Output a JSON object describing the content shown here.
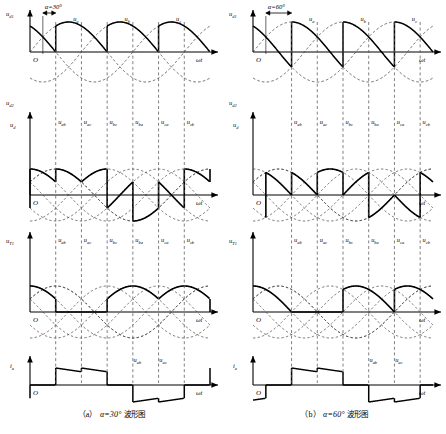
{
  "figure": {
    "background_color": "#ffffff",
    "line_color": "#000000",
    "dash_color": "#444444"
  },
  "panels": [
    {
      "id": "panel-a",
      "alpha_label": "α=30°",
      "alpha_deg": 30,
      "caption": "（a） α=30° 波形图",
      "caption_index": "（a）",
      "caption_text": "波形图",
      "axis_label_omega": "ωt",
      "origin_label": "O",
      "subplots": [
        {
          "id": "ud1",
          "y_label": "u d1",
          "y_label_main": "u",
          "y_label_sub": "d1",
          "phase_labels": [
            "u a",
            "u b",
            "u c"
          ],
          "phase_label_mains": [
            "u",
            "u",
            "u"
          ],
          "phase_label_subs": [
            "a",
            "b",
            "c"
          ],
          "description": "三相相电压及共阴极组输出电压波形"
        },
        {
          "id": "ud2",
          "y_label_top": "u d2",
          "y_label_top_main": "u",
          "y_label_top_sub": "d2",
          "y_label_bottom": "u d",
          "y_label_bottom_main": "u",
          "y_label_bottom_sub": "d",
          "line_voltage_labels": [
            "u ab",
            "u ac",
            "u bc",
            "u ba",
            "u ca",
            "u cb"
          ],
          "line_voltage_subs": [
            "ab",
            "ac",
            "bc",
            "ba",
            "ca",
            "cb"
          ],
          "description": "线电压与整流输出电压 ud 波形"
        },
        {
          "id": "uT1",
          "y_label": "u T1",
          "y_label_main": "u",
          "y_label_sub": "T1",
          "line_voltage_labels": [
            "u ab",
            "u ac",
            "u bc",
            "u ba",
            "u ca",
            "u cb"
          ],
          "line_voltage_subs": [
            "ab",
            "ac",
            "bc",
            "ba",
            "ca",
            "cb"
          ],
          "description": "晶闸管 T1 两端电压波形"
        },
        {
          "id": "ia",
          "y_label": "i a",
          "y_label_main": "i",
          "y_label_sub": "a",
          "marker_labels": [
            "u ab",
            "u ac"
          ],
          "marker_subs": [
            "ab",
            "ac"
          ],
          "description": "a 相电流波形"
        }
      ]
    },
    {
      "id": "panel-b",
      "alpha_label": "α=60°",
      "alpha_deg": 60,
      "caption": "（b） α=60° 波形图",
      "caption_index": "（b）",
      "caption_text": "波形图",
      "axis_label_omega": "ωt",
      "origin_label": "O",
      "subplots": [
        {
          "id": "ud1",
          "y_label": "u d1",
          "y_label_main": "u",
          "y_label_sub": "d1",
          "phase_labels": [
            "u a",
            "u b",
            "u c"
          ],
          "phase_label_mains": [
            "u",
            "u",
            "u"
          ],
          "phase_label_subs": [
            "a",
            "b",
            "c"
          ],
          "description": "三相相电压及共阴极组输出电压波形"
        },
        {
          "id": "ud2",
          "y_label_top": "u d2",
          "y_label_top_main": "u",
          "y_label_top_sub": "d2",
          "y_label_bottom": "u d",
          "y_label_bottom_main": "u",
          "y_label_bottom_sub": "d",
          "line_voltage_labels": [
            "u ab",
            "u ac",
            "u bc",
            "u ba",
            "u ca",
            "u cb"
          ],
          "line_voltage_subs": [
            "ab",
            "ac",
            "bc",
            "ba",
            "ca",
            "cb"
          ],
          "description": "线电压与整流输出电压 ud 波形"
        },
        {
          "id": "uT1",
          "y_label": "u T1",
          "y_label_main": "u",
          "y_label_sub": "T1",
          "line_voltage_labels": [
            "u ab",
            "u ac",
            "u bc",
            "u ba",
            "u ca",
            "u cb"
          ],
          "line_voltage_subs": [
            "ab",
            "ac",
            "bc",
            "ba",
            "ca",
            "cb"
          ],
          "description": "晶闸管 T1 两端电压波形"
        },
        {
          "id": "ia",
          "y_label": "i a",
          "y_label_main": "i",
          "y_label_sub": "a",
          "marker_labels": [
            "u ab",
            "u ac"
          ],
          "marker_subs": [
            "ab",
            "ac"
          ],
          "description": "a 相电流波形"
        }
      ]
    }
  ],
  "chart_data": {
    "type": "line",
    "xlabel": "ωt",
    "ylabel": "u, i",
    "grid": "dashed-vertical-commutation-lines",
    "legend": "none",
    "series_names": [
      "u_a",
      "u_b",
      "u_c",
      "u_d1 (common-cathode output)",
      "u_d2 (common-anode output)",
      "u_d (rectified output)",
      "u_T1 (thyristor voltage)",
      "i_a (phase current)"
    ],
    "alphas_deg": [
      30,
      60
    ],
    "commutation_interval_deg": 60,
    "pulses_per_cycle": 6,
    "x_range_deg": [
      0,
      420
    ],
    "phase_amplitude": 1.0,
    "line_amplitude": 1.732,
    "natural_commutation_points_deg": [
      30,
      90,
      150,
      210,
      270,
      330,
      390
    ],
    "firing_points_alpha30_deg": [
      60,
      120,
      180,
      240,
      300,
      360
    ],
    "firing_points_alpha60_deg": [
      90,
      150,
      210,
      270,
      330,
      390
    ],
    "ud_mean_alpha30": 2.34,
    "ud_mean_alpha60": 1.35
  }
}
